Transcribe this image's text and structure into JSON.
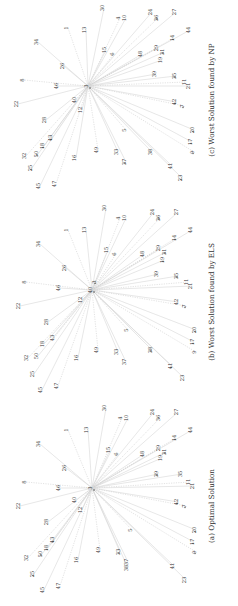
{
  "figure": {
    "orientation": "rotated-90-ccw",
    "panels": [
      {
        "id": "a",
        "caption": "(a) Optimal Solution",
        "hub": "3",
        "caption_pos": [
          214,
          506
        ],
        "hub_pos": [
          92,
          488
        ],
        "nodes": [
          {
            "label": "1",
            "x": 68,
            "y": 430,
            "dot": false
          },
          {
            "label": "34",
            "x": 40,
            "y": 444,
            "dot": false
          },
          {
            "label": "26",
            "x": 66,
            "y": 468,
            "dot": false
          },
          {
            "label": "8",
            "x": 26,
            "y": 482,
            "dot": false
          },
          {
            "label": "46",
            "x": 60,
            "y": 488,
            "dot": false
          },
          {
            "label": "22",
            "x": 20,
            "y": 506,
            "dot": false
          },
          {
            "label": "40",
            "x": 76,
            "y": 500,
            "dot": false
          },
          {
            "label": "12",
            "x": 82,
            "y": 510,
            "dot": false
          },
          {
            "label": "28",
            "x": 48,
            "y": 522,
            "dot": false
          },
          {
            "label": "43",
            "x": 54,
            "y": 540,
            "dot": true
          },
          {
            "label": "18",
            "x": 48,
            "y": 548,
            "dot": true
          },
          {
            "label": "50",
            "x": 42,
            "y": 554,
            "dot": true
          },
          {
            "label": "32",
            "x": 28,
            "y": 558,
            "dot": false
          },
          {
            "label": "25",
            "x": 34,
            "y": 574,
            "dot": true
          },
          {
            "label": "45",
            "x": 44,
            "y": 590,
            "dot": false
          },
          {
            "label": "47",
            "x": 60,
            "y": 586,
            "dot": false
          },
          {
            "label": "16",
            "x": 78,
            "y": 560,
            "dot": false
          },
          {
            "label": "38",
            "x": 128,
            "y": 568,
            "dot": false
          },
          {
            "label": "49",
            "x": 100,
            "y": 550,
            "dot": false
          },
          {
            "label": "33",
            "x": 120,
            "y": 552,
            "dot": true
          },
          {
            "label": "37",
            "x": 128,
            "y": 562,
            "dot": false
          },
          {
            "label": "5",
            "x": 132,
            "y": 530,
            "dot": false
          },
          {
            "label": "30",
            "x": 106,
            "y": 408,
            "dot": false
          },
          {
            "label": "13",
            "x": 88,
            "y": 430,
            "dot": false
          },
          {
            "label": "4",
            "x": 122,
            "y": 418,
            "dot": false
          },
          {
            "label": "10",
            "x": 128,
            "y": 418,
            "dot": false
          },
          {
            "label": "15",
            "x": 110,
            "y": 450,
            "dot": false
          },
          {
            "label": "6",
            "x": 118,
            "y": 454,
            "dot": false
          },
          {
            "label": "48",
            "x": 144,
            "y": 454,
            "dot": false
          },
          {
            "label": "24",
            "x": 154,
            "y": 412,
            "dot": false
          },
          {
            "label": "36",
            "x": 160,
            "y": 418,
            "dot": false
          },
          {
            "label": "27",
            "x": 178,
            "y": 412,
            "dot": false
          },
          {
            "label": "44",
            "x": 192,
            "y": 430,
            "dot": false
          },
          {
            "label": "14",
            "x": 176,
            "y": 438,
            "dot": true
          },
          {
            "label": "31",
            "x": 166,
            "y": 452,
            "dot": true
          },
          {
            "label": "19",
            "x": 162,
            "y": 458,
            "dot": false
          },
          {
            "label": "29",
            "x": 160,
            "y": 448,
            "dot": false
          },
          {
            "label": "39",
            "x": 158,
            "y": 474,
            "dot": true
          },
          {
            "label": "35",
            "x": 182,
            "y": 474,
            "dot": false
          },
          {
            "label": "11",
            "x": 190,
            "y": 482,
            "dot": false
          },
          {
            "label": "21",
            "x": 194,
            "y": 486,
            "dot": false
          },
          {
            "label": "42",
            "x": 178,
            "y": 502,
            "dot": true
          },
          {
            "label": "7",
            "x": 186,
            "y": 506,
            "dot": true
          },
          {
            "label": "20",
            "x": 196,
            "y": 530,
            "dot": true
          },
          {
            "label": "17",
            "x": 194,
            "y": 542,
            "dot": true
          },
          {
            "label": "9",
            "x": 196,
            "y": 552,
            "dot": true
          },
          {
            "label": "41",
            "x": 174,
            "y": 566,
            "dot": false
          },
          {
            "label": "23",
            "x": 186,
            "y": 580,
            "dot": false
          }
        ]
      },
      {
        "id": "b",
        "caption": "(b) Worst Solution found by ELS",
        "hub": "40",
        "caption_pos": [
          214,
          302
        ],
        "hub_pos": [
          92,
          290
        ],
        "nodes": [
          {
            "label": "1",
            "x": 68,
            "y": 230,
            "dot": false
          },
          {
            "label": "34",
            "x": 40,
            "y": 244,
            "dot": false
          },
          {
            "label": "26",
            "x": 66,
            "y": 268,
            "dot": false
          },
          {
            "label": "8",
            "x": 26,
            "y": 282,
            "dot": false
          },
          {
            "label": "46",
            "x": 60,
            "y": 288,
            "dot": false
          },
          {
            "label": "22",
            "x": 20,
            "y": 306,
            "dot": false
          },
          {
            "label": "3",
            "x": 96,
            "y": 282,
            "dot": true
          },
          {
            "label": "12",
            "x": 82,
            "y": 300,
            "dot": false
          },
          {
            "label": "28",
            "x": 48,
            "y": 322,
            "dot": false
          },
          {
            "label": "43",
            "x": 54,
            "y": 338,
            "dot": false
          },
          {
            "label": "18",
            "x": 44,
            "y": 344,
            "dot": false
          },
          {
            "label": "50",
            "x": 38,
            "y": 356,
            "dot": false
          },
          {
            "label": "32",
            "x": 28,
            "y": 358,
            "dot": false
          },
          {
            "label": "25",
            "x": 34,
            "y": 374,
            "dot": false
          },
          {
            "label": "45",
            "x": 42,
            "y": 390,
            "dot": false
          },
          {
            "label": "47",
            "x": 58,
            "y": 386,
            "dot": false
          },
          {
            "label": "16",
            "x": 78,
            "y": 358,
            "dot": false
          },
          {
            "label": "38",
            "x": 152,
            "y": 350,
            "dot": true
          },
          {
            "label": "49",
            "x": 98,
            "y": 350,
            "dot": false
          },
          {
            "label": "33",
            "x": 118,
            "y": 352,
            "dot": false
          },
          {
            "label": "37",
            "x": 126,
            "y": 362,
            "dot": false
          },
          {
            "label": "5",
            "x": 128,
            "y": 330,
            "dot": false
          },
          {
            "label": "30",
            "x": 106,
            "y": 208,
            "dot": false
          },
          {
            "label": "13",
            "x": 86,
            "y": 230,
            "dot": false
          },
          {
            "label": "4",
            "x": 120,
            "y": 218,
            "dot": false
          },
          {
            "label": "10",
            "x": 126,
            "y": 218,
            "dot": false
          },
          {
            "label": "15",
            "x": 108,
            "y": 250,
            "dot": false
          },
          {
            "label": "6",
            "x": 116,
            "y": 254,
            "dot": false
          },
          {
            "label": "48",
            "x": 144,
            "y": 254,
            "dot": false
          },
          {
            "label": "24",
            "x": 154,
            "y": 212,
            "dot": false
          },
          {
            "label": "36",
            "x": 160,
            "y": 218,
            "dot": true
          },
          {
            "label": "27",
            "x": 178,
            "y": 212,
            "dot": false
          },
          {
            "label": "44",
            "x": 192,
            "y": 230,
            "dot": false
          },
          {
            "label": "14",
            "x": 176,
            "y": 238,
            "dot": true
          },
          {
            "label": "31",
            "x": 166,
            "y": 252,
            "dot": true
          },
          {
            "label": "19",
            "x": 164,
            "y": 260,
            "dot": true
          },
          {
            "label": "29",
            "x": 160,
            "y": 248,
            "dot": false
          },
          {
            "label": "39",
            "x": 158,
            "y": 274,
            "dot": false
          },
          {
            "label": "35",
            "x": 178,
            "y": 276,
            "dot": true
          },
          {
            "label": "11",
            "x": 188,
            "y": 282,
            "dot": false
          },
          {
            "label": "21",
            "x": 192,
            "y": 286,
            "dot": false
          },
          {
            "label": "42",
            "x": 178,
            "y": 302,
            "dot": false
          },
          {
            "label": "7",
            "x": 186,
            "y": 306,
            "dot": true
          },
          {
            "label": "20",
            "x": 196,
            "y": 330,
            "dot": true
          },
          {
            "label": "17",
            "x": 194,
            "y": 342,
            "dot": true
          },
          {
            "label": "9",
            "x": 196,
            "y": 352,
            "dot": false
          },
          {
            "label": "41",
            "x": 172,
            "y": 366,
            "dot": true
          },
          {
            "label": "23",
            "x": 184,
            "y": 378,
            "dot": false
          }
        ]
      },
      {
        "id": "c",
        "caption": "(c) Worst Solution found by NP",
        "hub": "3",
        "caption_pos": [
          214,
          100
        ],
        "hub_pos": [
          88,
          86
        ],
        "nodes": [
          {
            "label": "1",
            "x": 68,
            "y": 28,
            "dot": false
          },
          {
            "label": "34",
            "x": 38,
            "y": 42,
            "dot": false
          },
          {
            "label": "26",
            "x": 64,
            "y": 66,
            "dot": false
          },
          {
            "label": "8",
            "x": 24,
            "y": 80,
            "dot": false
          },
          {
            "label": "46",
            "x": 58,
            "y": 86,
            "dot": false
          },
          {
            "label": "22",
            "x": 18,
            "y": 104,
            "dot": false
          },
          {
            "label": "40",
            "x": 76,
            "y": 100,
            "dot": false
          },
          {
            "label": "12",
            "x": 82,
            "y": 110,
            "dot": false
          },
          {
            "label": "28",
            "x": 46,
            "y": 120,
            "dot": false
          },
          {
            "label": "43",
            "x": 52,
            "y": 138,
            "dot": true
          },
          {
            "label": "18",
            "x": 44,
            "y": 146,
            "dot": true
          },
          {
            "label": "50",
            "x": 38,
            "y": 154,
            "dot": true
          },
          {
            "label": "32",
            "x": 26,
            "y": 156,
            "dot": false
          },
          {
            "label": "25",
            "x": 32,
            "y": 168,
            "dot": true
          },
          {
            "label": "45",
            "x": 40,
            "y": 186,
            "dot": false
          },
          {
            "label": "47",
            "x": 56,
            "y": 184,
            "dot": false
          },
          {
            "label": "16",
            "x": 76,
            "y": 158,
            "dot": false
          },
          {
            "label": "38",
            "x": 152,
            "y": 152,
            "dot": false
          },
          {
            "label": "49",
            "x": 98,
            "y": 150,
            "dot": false
          },
          {
            "label": "33",
            "x": 118,
            "y": 152,
            "dot": false
          },
          {
            "label": "37",
            "x": 126,
            "y": 162,
            "dot": true
          },
          {
            "label": "5",
            "x": 126,
            "y": 130,
            "dot": false
          },
          {
            "label": "30",
            "x": 104,
            "y": 8,
            "dot": false
          },
          {
            "label": "13",
            "x": 86,
            "y": 30,
            "dot": false
          },
          {
            "label": "4",
            "x": 120,
            "y": 18,
            "dot": false
          },
          {
            "label": "10",
            "x": 126,
            "y": 18,
            "dot": false
          },
          {
            "label": "15",
            "x": 106,
            "y": 50,
            "dot": false
          },
          {
            "label": "6",
            "x": 114,
            "y": 54,
            "dot": false
          },
          {
            "label": "48",
            "x": 142,
            "y": 54,
            "dot": false
          },
          {
            "label": "24",
            "x": 152,
            "y": 12,
            "dot": false
          },
          {
            "label": "36",
            "x": 158,
            "y": 18,
            "dot": true
          },
          {
            "label": "27",
            "x": 176,
            "y": 12,
            "dot": false
          },
          {
            "label": "44",
            "x": 190,
            "y": 30,
            "dot": false
          },
          {
            "label": "14",
            "x": 174,
            "y": 38,
            "dot": true
          },
          {
            "label": "31",
            "x": 164,
            "y": 52,
            "dot": true
          },
          {
            "label": "19",
            "x": 162,
            "y": 60,
            "dot": false
          },
          {
            "label": "29",
            "x": 158,
            "y": 48,
            "dot": false
          },
          {
            "label": "39",
            "x": 156,
            "y": 74,
            "dot": false
          },
          {
            "label": "35",
            "x": 176,
            "y": 76,
            "dot": true
          },
          {
            "label": "11",
            "x": 186,
            "y": 82,
            "dot": false
          },
          {
            "label": "21",
            "x": 190,
            "y": 86,
            "dot": false
          },
          {
            "label": "42",
            "x": 176,
            "y": 102,
            "dot": true
          },
          {
            "label": "7",
            "x": 184,
            "y": 106,
            "dot": true
          },
          {
            "label": "20",
            "x": 194,
            "y": 130,
            "dot": true
          },
          {
            "label": "17",
            "x": 192,
            "y": 142,
            "dot": true
          },
          {
            "label": "9",
            "x": 194,
            "y": 152,
            "dot": true
          },
          {
            "label": "41",
            "x": 172,
            "y": 166,
            "dot": false
          },
          {
            "label": "23",
            "x": 182,
            "y": 178,
            "dot": true
          }
        ]
      }
    ]
  }
}
